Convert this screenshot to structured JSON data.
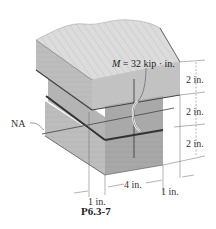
{
  "figure": {
    "caption": "P6.3-7",
    "moment_label": {
      "symbol": "M",
      "equals": " = 32 kip · in."
    },
    "neutral_axis_label": "NA",
    "dimensions": {
      "heights": [
        "2 in.",
        "2 in.",
        "2 in."
      ],
      "web_width": "4 in.",
      "left_overhang": "1 in.",
      "right_overhang": "1 in."
    },
    "colors": {
      "wood_light": "#d8d8d8",
      "wood_mid": "#b8b8b8",
      "wood_dark": "#9a9a9a",
      "glue_line": "#555555",
      "dim_line": "#666666"
    }
  }
}
